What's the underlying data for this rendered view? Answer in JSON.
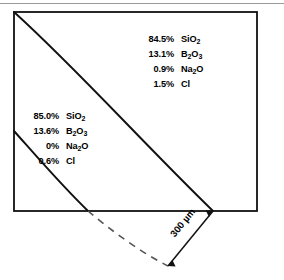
{
  "figure": {
    "top_rule": "horizontal-rule",
    "frame": "specimen-outline-rectangle",
    "upper_composition": {
      "rows": [
        {
          "pct": "84.5%",
          "formula": "SiO2",
          "element": "SiO",
          "sub": "2",
          "tail": ""
        },
        {
          "pct": "13.1%",
          "formula": "B2O3",
          "element": "B",
          "sub": "2",
          "tail": "O",
          "sub2": "3"
        },
        {
          "pct": "0.9%",
          "formula": "Na2O",
          "element": "Na",
          "sub": "2",
          "tail": "O"
        },
        {
          "pct": "1.5%",
          "formula": "Cl",
          "element": "Cl",
          "sub": "",
          "tail": ""
        }
      ]
    },
    "lower_composition": {
      "rows": [
        {
          "pct": "85.0%",
          "formula": "SiO2",
          "element": "SiO",
          "sub": "2",
          "tail": ""
        },
        {
          "pct": "13.6%",
          "formula": "B2O3",
          "element": "B",
          "sub": "2",
          "tail": "O",
          "sub2": "3"
        },
        {
          "pct": "0%",
          "formula": "Na2O",
          "element": "Na",
          "sub": "2",
          "tail": "O"
        },
        {
          "pct": "0.6%",
          "formula": "Cl",
          "element": "Cl",
          "sub": "",
          "tail": ""
        }
      ]
    },
    "dimension": {
      "label": "300 µm",
      "value": "300",
      "unit": "µm"
    },
    "colors": {
      "line": "#000000",
      "rule": "#9b9b9b",
      "dashed": "#555555",
      "background": "#ffffff"
    }
  }
}
